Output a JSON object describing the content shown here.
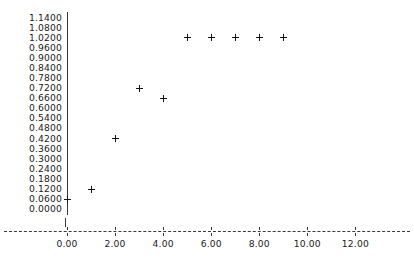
{
  "chart_data": {
    "type": "scatter",
    "title": "",
    "xlabel": "",
    "ylabel": "",
    "xlim": [
      0.0,
      12.0
    ],
    "ylim": [
      0.0,
      1.14
    ],
    "grid": false,
    "legend": null,
    "marker": "+",
    "x": [
      0,
      1,
      2,
      3,
      4,
      5,
      6,
      7,
      8,
      9
    ],
    "y": [
      0.06,
      0.12,
      0.42,
      0.72,
      0.66,
      1.02,
      1.02,
      1.02,
      1.02,
      1.02
    ],
    "points": [
      {
        "x": 0,
        "y": 0.06
      },
      {
        "x": 1,
        "y": 0.12
      },
      {
        "x": 2,
        "y": 0.42
      },
      {
        "x": 3,
        "y": 0.72
      },
      {
        "x": 4,
        "y": 0.66
      },
      {
        "x": 5,
        "y": 1.02
      },
      {
        "x": 6,
        "y": 1.02
      },
      {
        "x": 7,
        "y": 1.02
      },
      {
        "x": 8,
        "y": 1.02
      },
      {
        "x": 9,
        "y": 1.02
      }
    ],
    "y_ticks": [
      "1.1400",
      "1.0800",
      "1.0200",
      "0.9600",
      "0.9000",
      "0.8400",
      "0.7800",
      "0.7200",
      "0.6600",
      "0.6000",
      "0.5400",
      "0.4800",
      "0.4200",
      "0.3600",
      "0.3000",
      "0.2400",
      "0.1800",
      "0.1200",
      "0.0600",
      "0.0000"
    ],
    "y_tick_values": [
      1.14,
      1.08,
      1.02,
      0.96,
      0.9,
      0.84,
      0.78,
      0.72,
      0.66,
      0.6,
      0.54,
      0.48,
      0.42,
      0.36,
      0.3,
      0.24,
      0.18,
      0.12,
      0.06,
      0.0
    ],
    "x_ticks": [
      "0.00",
      "2.00",
      "4.00",
      "6.00",
      "8.00",
      "10.00",
      "12.00"
    ],
    "x_tick_values": [
      0,
      2,
      4,
      6,
      8,
      10,
      12
    ],
    "colors": {
      "marker": "#151515",
      "axis": "#3a3a3a",
      "text": "#1a1a1a",
      "background": "#ffffff"
    }
  }
}
